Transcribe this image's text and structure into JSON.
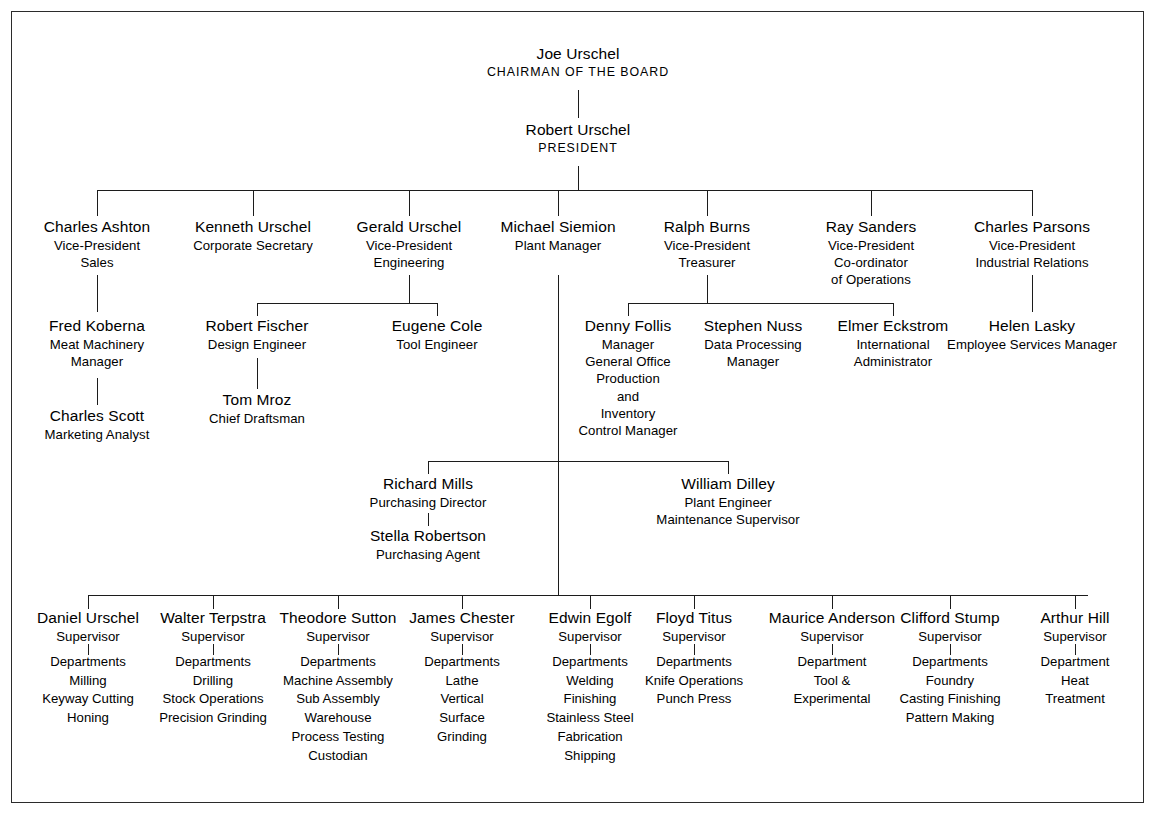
{
  "document": {
    "type": "organization-chart",
    "border_color": "#2b2b2b",
    "line_color": "#1c1c1c"
  },
  "chairman": {
    "name": "Joe Urschel",
    "title": "CHAIRMAN OF THE BOARD"
  },
  "president": {
    "name": "Robert Urschel",
    "title": "PRESIDENT"
  },
  "executives": [
    {
      "name": "Charles Ashton",
      "title_line1": "Vice-President",
      "title_line2": "Sales"
    },
    {
      "name": "Kenneth Urschel",
      "title_line1": "Corporate Secretary",
      "title_line2": ""
    },
    {
      "name": "Gerald Urschel",
      "title_line1": "Vice-President",
      "title_line2": "Engineering"
    },
    {
      "name": "Michael Siemion",
      "title_line1": "Plant Manager",
      "title_line2": ""
    },
    {
      "name": "Ralph Burns",
      "title_line1": "Vice-President",
      "title_line2": "Treasurer"
    },
    {
      "name": "Ray Sanders",
      "title_line1": "Vice-President",
      "title_line2": "Co-ordinator",
      "title_line3": "of Operations"
    },
    {
      "name": "Charles Parsons",
      "title_line1": "Vice-President",
      "title_line2": "Industrial Relations"
    }
  ],
  "sales_chain": {
    "koberna": {
      "name": "Fred Koberna",
      "title_line1": "Meat Machinery",
      "title_line2": "Manager"
    },
    "scott": {
      "name": "Charles Scott",
      "title_line1": "Marketing Analyst"
    }
  },
  "engineering": {
    "fischer": {
      "name": "Robert Fischer",
      "title_line1": "Design Engineer"
    },
    "mroz": {
      "name": "Tom Mroz",
      "title_line1": "Chief Draftsman"
    },
    "cole": {
      "name": "Eugene Cole",
      "title_line1": "Tool Engineer"
    }
  },
  "treasury": {
    "follis": {
      "name": "Denny Follis",
      "lines": [
        "Manager",
        "General Office",
        "Production",
        "and",
        "Inventory",
        "Control Manager"
      ]
    },
    "nuss": {
      "name": "Stephen Nuss",
      "lines": [
        "Data Processing",
        "Manager"
      ]
    },
    "eckstrom": {
      "name": "Elmer Eckstrom",
      "lines": [
        "International",
        "Administrator"
      ]
    }
  },
  "industrial_relations": {
    "lasky": {
      "name": "Helen Lasky",
      "title_line1": "Employee Services Manager"
    }
  },
  "plant_staff": {
    "mills": {
      "name": "Richard Mills",
      "title_line1": "Purchasing Director"
    },
    "robertson": {
      "name": "Stella Robertson",
      "title_line1": "Purchasing Agent"
    },
    "dilley": {
      "name": "William Dilley",
      "title_line1": "Plant Engineer",
      "title_line2": "Maintenance Supervisor"
    }
  },
  "supervisors": [
    {
      "name": "Daniel Urschel",
      "role": "Supervisor",
      "dept_header": "Departments",
      "departments": [
        "Milling",
        "Keyway Cutting",
        "Honing"
      ]
    },
    {
      "name": "Walter Terpstra",
      "role": "Supervisor",
      "dept_header": "Departments",
      "departments": [
        "Drilling",
        "Stock Operations",
        "Precision Grinding"
      ]
    },
    {
      "name": "Theodore Sutton",
      "role": "Supervisor",
      "dept_header": "Departments",
      "departments": [
        "Machine Assembly",
        "Sub Assembly",
        "Warehouse",
        "Process Testing",
        "Custodian"
      ]
    },
    {
      "name": "James Chester",
      "role": "Supervisor",
      "dept_header": "Departments",
      "departments": [
        "Lathe",
        "Vertical",
        "Surface",
        "Grinding"
      ]
    },
    {
      "name": "Edwin Egolf",
      "role": "Supervisor",
      "dept_header": "Departments",
      "departments": [
        "Welding",
        "Finishing",
        "Stainless Steel",
        "Fabrication",
        "Shipping"
      ]
    },
    {
      "name": "Floyd Titus",
      "role": "Supervisor",
      "dept_header": "Departments",
      "departments": [
        "Knife Operations",
        "Punch Press"
      ]
    },
    {
      "name": "Maurice Anderson",
      "role": "Supervisor",
      "dept_header": "Department",
      "departments": [
        "Tool &",
        "Experimental"
      ]
    },
    {
      "name": "Clifford Stump",
      "role": "Supervisor",
      "dept_header": "Departments",
      "departments": [
        "Foundry",
        "Casting Finishing",
        "Pattern Making"
      ]
    },
    {
      "name": "Arthur Hill",
      "role": "Supervisor",
      "dept_header": "Department",
      "departments": [
        "Heat",
        "Treatment"
      ]
    }
  ]
}
